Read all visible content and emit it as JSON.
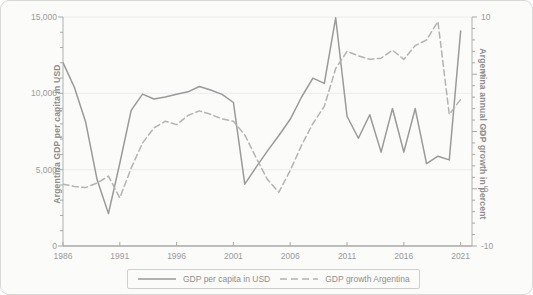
{
  "chart_data": {
    "type": "line",
    "title": "",
    "xlabel": "",
    "ylabel": "Argentina GDP per capita in USD",
    "y2label": "Argentina annual GDP growth in percent",
    "grid": true,
    "legend_position": "bottom",
    "xlim": [
      1986,
      2022
    ],
    "ylim": [
      0,
      15000
    ],
    "y2lim": [
      -10,
      10
    ],
    "xticks": [
      "1986",
      "1991",
      "1996",
      "2001",
      "2006",
      "2011",
      "2016",
      "2021"
    ],
    "xtick_values": [
      1986,
      1991,
      1996,
      2001,
      2006,
      2011,
      2016,
      2021
    ],
    "yticks": [
      "0",
      "5,000",
      "10,000",
      "15,000"
    ],
    "ytick_values": [
      0,
      5000,
      10000,
      15000
    ],
    "y2ticks": [
      "-10",
      "-5",
      "0",
      "5",
      "10"
    ],
    "y2tick_values": [
      -10,
      -5,
      0,
      5,
      10
    ],
    "x": [
      1986,
      1987,
      1988,
      1989,
      1990,
      1991,
      1992,
      1993,
      1994,
      1995,
      1996,
      1997,
      1998,
      1999,
      2000,
      2001,
      2002,
      2003,
      2004,
      2005,
      2006,
      2007,
      2008,
      2009,
      2010,
      2011,
      2012,
      2013,
      2014,
      2015,
      2016,
      2017,
      2018,
      2019,
      2020,
      2021
    ],
    "series": [
      {
        "name": "GDP per capita in USD",
        "axis": "left",
        "style": "solid",
        "color": "#9a9a9a",
        "unit": "USD",
        "values": [
          12010,
          10400,
          8100,
          4350,
          2120,
          5420,
          8880,
          9950,
          9630,
          9760,
          9940,
          10100,
          10450,
          10220,
          9930,
          9400,
          4050,
          5170,
          6230,
          7240,
          8300,
          9760,
          11000,
          10650,
          14950,
          8500,
          7060,
          8600,
          6150,
          9010,
          6160,
          9000,
          5400,
          5880,
          5640,
          14080
        ]
      },
      {
        "name": "GDP growth Argentina",
        "axis": "right",
        "style": "dashed",
        "color": "#b3b3b3",
        "unit": "percent",
        "values": [
          -4.6,
          -4.8,
          -4.9,
          -4.5,
          -3.9,
          -5.8,
          -3.2,
          -1.0,
          0.3,
          0.9,
          0.6,
          1.4,
          1.8,
          1.5,
          1.1,
          0.9,
          -0.3,
          -2.3,
          -4.2,
          -5.3,
          -3.4,
          -1.2,
          0.7,
          2.2,
          5.5,
          7.0,
          6.6,
          6.3,
          6.4,
          7.1,
          6.3,
          7.5,
          8.0,
          9.6,
          1.5,
          2.8
        ]
      }
    ]
  },
  "legend": {
    "entries": [
      {
        "label": "GDP per capita in USD",
        "style": "solid"
      },
      {
        "label": "GDP growth Argentina",
        "style": "dashed"
      }
    ]
  }
}
